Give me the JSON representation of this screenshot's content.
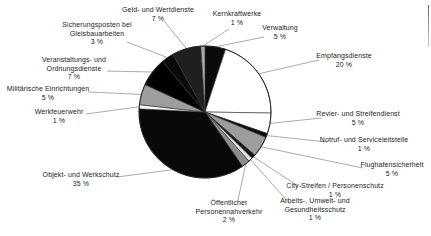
{
  "chart_data": {
    "type": "pie",
    "title": "",
    "unit": "%",
    "legend": "none",
    "background_color": "#ffffff",
    "leader_line_color": "#8f8f8f",
    "outline_color": "#1a1a1a",
    "pie": {
      "cx": 205,
      "cy": 112,
      "r": 66,
      "start_angle_deg": 0,
      "direction": "clockwise"
    },
    "slices": [
      {
        "id": "verwaltung",
        "name": "Verwaltung",
        "value": 5,
        "percent_label": "5 %",
        "color": "#0b0b0b",
        "name_lines": [
          "Verwaltung"
        ],
        "label_x": 280,
        "label_y": 24,
        "attach_x": 264,
        "attach_y": 37
      },
      {
        "id": "empfangsdienste",
        "name": "Empfangsdienste",
        "value": 20,
        "percent_label": "20 %",
        "color": "#ffffff",
        "name_lines": [
          "Empfangsdienste"
        ],
        "label_x": 344,
        "label_y": 52,
        "attach_x": 319,
        "attach_y": 60
      },
      {
        "id": "revier-und-streifendienst",
        "name": "Revier- und Streifendienst",
        "value": 5,
        "percent_label": "5 %",
        "color": "#ffffff",
        "name_lines": [
          "Revier- und Streifendienst"
        ],
        "label_x": 358,
        "label_y": 110,
        "attach_x": 321,
        "attach_y": 118
      },
      {
        "id": "notruf-und-serviceleitstelle",
        "name": "Notruf- und Serviceleitstelle",
        "value": 1,
        "percent_label": "1 %",
        "color": "#0d0d0d",
        "name_lines": [
          "Notruf- und Serviceleitstelle"
        ],
        "label_x": 364,
        "label_y": 136,
        "attach_x": 327,
        "attach_y": 142
      },
      {
        "id": "flughafensicherheit",
        "name": "Flughafensicherheit",
        "value": 5,
        "percent_label": "5 %",
        "color": "#9d9d9d",
        "name_lines": [
          "Flughafensicherheit"
        ],
        "label_x": 392,
        "label_y": 161,
        "attach_x": 363,
        "attach_y": 168
      },
      {
        "id": "city-streifen-personenschutz",
        "name": "City-Streifen / Personenschutz",
        "value": 1,
        "percent_label": "1 %",
        "color": "#141414",
        "name_lines": [
          "City-Streifen / Personenschutz"
        ],
        "label_x": 335,
        "label_y": 182,
        "attach_x": 298,
        "attach_y": 186
      },
      {
        "id": "arbeits-umwelt-gesundheitsschutz",
        "name": "Arbeits-, Umwelt- und Gesundheitsschutz",
        "value": 1,
        "percent_label": "1 %",
        "color": "#e3e3e3",
        "name_lines": [
          "Arbeits-, Umwelt- und",
          "Gesundheitsschutz"
        ],
        "label_x": 315,
        "label_y": 197,
        "attach_x": 290,
        "attach_y": 204
      },
      {
        "id": "oeffentlicher-personennahverkehr",
        "name": "Öffentlicher Personennahverkehr",
        "value": 2,
        "percent_label": "2 %",
        "color": "#8d8d8d",
        "name_lines": [
          "Öffentlicher",
          "Personennahverkehr"
        ],
        "label_x": 229,
        "label_y": 199,
        "attach_x": 238,
        "attach_y": 200
      },
      {
        "id": "objekt-und-werkschutz",
        "name": "Objekt- und Werkschutz",
        "value": 35,
        "percent_label": "35 %",
        "color": "#090909",
        "name_lines": [
          "Objekt- und Werkschutz"
        ],
        "label_x": 81,
        "label_y": 171,
        "attach_x": 117,
        "attach_y": 177
      },
      {
        "id": "werkfeuerwehr",
        "name": "Werkfeuerwehr",
        "value": 1,
        "percent_label": "1 %",
        "color": "#fafafa",
        "name_lines": [
          "Werkfeuerwehr"
        ],
        "label_x": 59,
        "label_y": 108,
        "attach_x": 86,
        "attach_y": 114
      },
      {
        "id": "militaerische-einrichtungen",
        "name": "Militärische Einrichtungen",
        "value": 5,
        "percent_label": "5 %",
        "color": "#9d9d9d",
        "name_lines": [
          "Militärische Einrichtungen"
        ],
        "label_x": 48,
        "label_y": 85,
        "attach_x": 88,
        "attach_y": 92
      },
      {
        "id": "veranstaltungs-und-ordnungsdienste",
        "name": "Veranstaltungs- und Ordnungsdienste",
        "value": 7,
        "percent_label": "7 %",
        "color": "#000000",
        "name_lines": [
          "Veranstaltungs- und",
          "Ordnungsdienste"
        ],
        "label_x": 74,
        "label_y": 56,
        "attach_x": 107,
        "attach_y": 71
      },
      {
        "id": "sicherungsposten-bei-gleisbauarbeiten",
        "name": "Sicherungsposten bei Gleisbauarbeiten",
        "value": 3,
        "percent_label": "3 %",
        "color": "#0a0a0a",
        "name_lines": [
          "Sicherungsposten bei",
          "Gleisbauarbeiten"
        ],
        "label_x": 97,
        "label_y": 21,
        "attach_x": 127,
        "attach_y": 42
      },
      {
        "id": "geld-und-wertdienste",
        "name": "Geld- und Wertdienste",
        "value": 7,
        "percent_label": "7 %",
        "color": "#1f1f1f",
        "name_lines": [
          "Geld- und Wertdienste"
        ],
        "label_x": 158,
        "label_y": 6,
        "attach_x": 164,
        "attach_y": 21
      },
      {
        "id": "kernkraftwerke",
        "name": "Kernkraftwerke",
        "value": 1,
        "percent_label": "1 %",
        "color": "#a8a8a8",
        "name_lines": [
          "Kernkraftwerke"
        ],
        "label_x": 237,
        "label_y": 10,
        "attach_x": 229,
        "attach_y": 29
      }
    ]
  }
}
